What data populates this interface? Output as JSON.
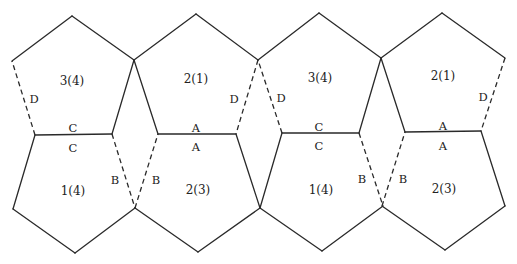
{
  "figure": {
    "stroke_color": "#2a2a2a",
    "background": "#ffffff"
  },
  "top_row": [
    {
      "id": "P1",
      "face_label": "3(4)",
      "label_pos": [
        72,
        81
      ],
      "points": [
        [
          72,
          16
        ],
        [
          134,
          60
        ],
        [
          112,
          134
        ],
        [
          35,
          135
        ],
        [
          12,
          61
        ]
      ],
      "edges": [
        {
          "from": 0,
          "to": 1,
          "style": "solid"
        },
        {
          "from": 1,
          "to": 2,
          "style": "solid"
        },
        {
          "from": 2,
          "to": 3,
          "style": "solid",
          "label": "C",
          "label_pos": [
            73,
            129
          ]
        },
        {
          "from": 3,
          "to": 4,
          "style": "dashed",
          "label": "D",
          "label_pos": [
            34,
            100
          ]
        },
        {
          "from": 4,
          "to": 0,
          "style": "solid"
        }
      ]
    },
    {
      "id": "P2",
      "face_label": "2(1)",
      "label_pos": [
        196,
        79
      ],
      "points": [
        [
          196,
          14
        ],
        [
          258,
          60
        ],
        [
          236,
          134
        ],
        [
          158,
          134
        ],
        [
          134,
          60
        ]
      ],
      "edges": [
        {
          "from": 0,
          "to": 1,
          "style": "solid"
        },
        {
          "from": 1,
          "to": 2,
          "style": "dashed",
          "label": "D",
          "label_pos": [
            234,
            100
          ]
        },
        {
          "from": 2,
          "to": 3,
          "style": "solid",
          "label": "A",
          "label_pos": [
            196,
            129
          ]
        },
        {
          "from": 3,
          "to": 4,
          "style": "solid"
        },
        {
          "from": 4,
          "to": 0,
          "style": "solid"
        }
      ]
    },
    {
      "id": "P3",
      "face_label": "3(4)",
      "label_pos": [
        320,
        78
      ],
      "points": [
        [
          319,
          13
        ],
        [
          381,
          58
        ],
        [
          359,
          133
        ],
        [
          282,
          133
        ],
        [
          258,
          60
        ]
      ],
      "edges": [
        {
          "from": 0,
          "to": 1,
          "style": "solid"
        },
        {
          "from": 1,
          "to": 2,
          "style": "solid"
        },
        {
          "from": 2,
          "to": 3,
          "style": "solid",
          "label": "C",
          "label_pos": [
            319,
            128
          ]
        },
        {
          "from": 3,
          "to": 4,
          "style": "dashed",
          "label": "D",
          "label_pos": [
            281,
            99
          ]
        },
        {
          "from": 4,
          "to": 0,
          "style": "solid"
        }
      ]
    },
    {
      "id": "P4",
      "face_label": "2(1)",
      "label_pos": [
        443,
        76
      ],
      "points": [
        [
          442,
          13
        ],
        [
          505,
          58
        ],
        [
          481,
          131
        ],
        [
          405,
          132
        ],
        [
          381,
          58
        ]
      ],
      "edges": [
        {
          "from": 0,
          "to": 1,
          "style": "solid"
        },
        {
          "from": 1,
          "to": 2,
          "style": "dashed",
          "label": "D",
          "label_pos": [
            483,
            98
          ]
        },
        {
          "from": 2,
          "to": 3,
          "style": "solid",
          "label": "A",
          "label_pos": [
            443,
            127
          ]
        },
        {
          "from": 3,
          "to": 4,
          "style": "solid"
        },
        {
          "from": 4,
          "to": 0,
          "style": "solid"
        }
      ]
    }
  ],
  "bottom_row": [
    {
      "id": "Q1",
      "face_label": "1(4)",
      "label_pos": [
        73,
        191
      ],
      "points": [
        [
          35,
          135
        ],
        [
          112,
          134
        ],
        [
          135,
          208
        ],
        [
          75,
          253
        ],
        [
          13,
          209
        ]
      ],
      "edges": [
        {
          "from": 0,
          "to": 1,
          "style": "solid",
          "label": "C",
          "label_pos": [
            73,
            149
          ]
        },
        {
          "from": 1,
          "to": 2,
          "style": "dashed",
          "label": "B",
          "label_pos": [
            115,
            181
          ]
        },
        {
          "from": 2,
          "to": 3,
          "style": "solid"
        },
        {
          "from": 3,
          "to": 4,
          "style": "solid"
        },
        {
          "from": 4,
          "to": 0,
          "style": "solid"
        }
      ]
    },
    {
      "id": "Q2",
      "face_label": "2(3)",
      "label_pos": [
        198,
        190
      ],
      "points": [
        [
          158,
          134
        ],
        [
          236,
          134
        ],
        [
          260,
          208
        ],
        [
          198,
          252
        ],
        [
          135,
          208
        ]
      ],
      "edges": [
        {
          "from": 0,
          "to": 1,
          "style": "solid",
          "label": "A",
          "label_pos": [
            196,
            148
          ]
        },
        {
          "from": 1,
          "to": 2,
          "style": "solid"
        },
        {
          "from": 2,
          "to": 3,
          "style": "solid"
        },
        {
          "from": 3,
          "to": 4,
          "style": "solid"
        },
        {
          "from": 4,
          "to": 0,
          "style": "dashed",
          "label": "B",
          "label_pos": [
            156,
            181
          ]
        }
      ]
    },
    {
      "id": "Q3",
      "face_label": "1(4)",
      "label_pos": [
        321,
        190
      ],
      "points": [
        [
          282,
          133
        ],
        [
          359,
          133
        ],
        [
          383,
          206
        ],
        [
          322,
          251
        ],
        [
          260,
          208
        ]
      ],
      "edges": [
        {
          "from": 0,
          "to": 1,
          "style": "solid",
          "label": "C",
          "label_pos": [
            319,
            147
          ]
        },
        {
          "from": 1,
          "to": 2,
          "style": "dashed",
          "label": "B",
          "label_pos": [
            362,
            180
          ]
        },
        {
          "from": 2,
          "to": 3,
          "style": "solid"
        },
        {
          "from": 3,
          "to": 4,
          "style": "solid"
        },
        {
          "from": 4,
          "to": 0,
          "style": "solid"
        }
      ]
    },
    {
      "id": "Q4",
      "face_label": "2(3)",
      "label_pos": [
        444,
        189
      ],
      "points": [
        [
          405,
          132
        ],
        [
          481,
          131
        ],
        [
          505,
          206
        ],
        [
          445,
          250
        ],
        [
          382,
          206
        ]
      ],
      "edges": [
        {
          "from": 0,
          "to": 1,
          "style": "solid",
          "label": "A",
          "label_pos": [
            443,
            147
          ]
        },
        {
          "from": 1,
          "to": 2,
          "style": "solid"
        },
        {
          "from": 2,
          "to": 3,
          "style": "solid"
        },
        {
          "from": 3,
          "to": 4,
          "style": "solid"
        },
        {
          "from": 4,
          "to": 0,
          "style": "dashed",
          "label": "B",
          "label_pos": [
            403,
            180
          ]
        }
      ]
    }
  ]
}
